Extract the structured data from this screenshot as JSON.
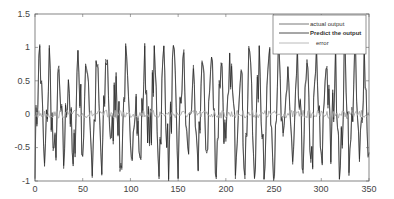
{
  "chart_data": {
    "type": "line",
    "title": "",
    "xlabel": "",
    "ylabel": "",
    "xlim": [
      0,
      350
    ],
    "ylim": [
      -1,
      1.5
    ],
    "xticks": [
      0,
      50,
      100,
      150,
      200,
      250,
      300,
      350
    ],
    "yticks": [
      -1,
      -0.5,
      0,
      0.5,
      1,
      1.5
    ],
    "grid": false,
    "legend_position": "upper right",
    "series": [
      {
        "name": "actual output",
        "color": "#555555"
      },
      {
        "name": "Predict the output",
        "color": "#222222"
      },
      {
        "name": "error",
        "color": "#a8a8a8"
      }
    ],
    "x_step": 5,
    "actual_output_samples": [
      -0.6,
      1.0,
      -0.9,
      0.8,
      -0.85,
      0.5,
      -0.7,
      0.7,
      -0.95,
      0.95,
      -0.5,
      0.9,
      -0.8,
      0.75,
      -0.9,
      1.02,
      -0.6,
      0.65,
      -0.85,
      0.85,
      -0.7,
      0.4,
      -0.8,
      0.95,
      -0.6,
      0.9,
      -0.75,
      1.0,
      -0.9,
      0.85,
      -0.8,
      0.95,
      -0.7,
      0.6,
      -0.9,
      0.75,
      -0.5,
      0.85,
      -0.8,
      0.95,
      -0.7,
      0.8,
      -0.6,
      0.9,
      -0.85,
      1.0,
      -0.95,
      0.85,
      -0.7,
      0.9,
      -0.8,
      1.0,
      -0.75,
      0.8,
      -0.9,
      0.6,
      -0.7,
      0.55,
      -0.75,
      0.8,
      -0.9,
      0.95,
      -0.6,
      0.85,
      -0.95,
      1.0,
      -0.8,
      0.9,
      -0.85,
      0.95,
      -0.7
    ],
    "error_range": [
      -0.08,
      0.08
    ]
  },
  "legend": {
    "items": [
      {
        "label": "actual output"
      },
      {
        "label": "Predict the output"
      },
      {
        "label": "error"
      }
    ]
  },
  "axes": {
    "y_tick_labels": [
      "1.5",
      "1",
      "0.5",
      "0",
      "-0.5",
      "-1"
    ],
    "x_tick_labels": [
      "0",
      "50",
      "100",
      "150",
      "200",
      "250",
      "300",
      "350"
    ]
  }
}
